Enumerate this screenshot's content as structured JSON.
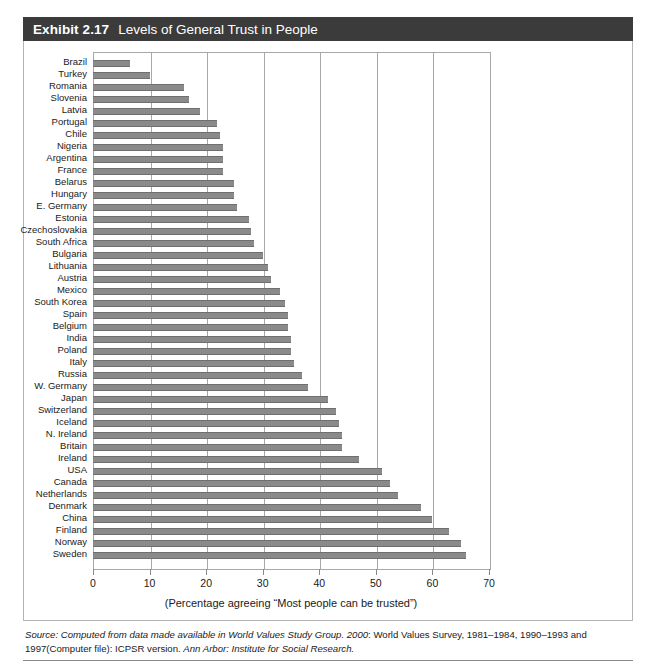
{
  "exhibit": {
    "label": "Exhibit 2.17",
    "title": "Levels of General Trust in People",
    "header_bg": "#3b3b3b",
    "bar_color": "#8a8a8a"
  },
  "axis_caption": "(Percentage agreeing “Most people can be trusted”)",
  "source": {
    "prefix": "Source:",
    "part_italic_1": "Computed from data made available in World Values Study Group. 2000",
    "part_plain_1": ": World Values Survey, 1981–1984, 1990–1993 and 1997(Computer file): ICPSR version. ",
    "part_italic_2": "Ann Arbor: Institute for Social Research."
  },
  "chart_data": {
    "type": "bar",
    "orientation": "horizontal",
    "title": "Levels of General Trust in People",
    "xlabel": "(Percentage agreeing “Most people can be trusted”)",
    "ylabel": "",
    "xlim": [
      0,
      70
    ],
    "xticks": [
      0,
      10,
      20,
      30,
      40,
      50,
      60,
      70
    ],
    "grid": true,
    "legend": "none",
    "categories": [
      "Brazil",
      "Turkey",
      "Romania",
      "Slovenia",
      "Latvia",
      "Portugal",
      "Chile",
      "Nigeria",
      "Argentina",
      "France",
      "Belarus",
      "Hungary",
      "E. Germany",
      "Estonia",
      "Czechoslovakia",
      "South Africa",
      "Bulgaria",
      "Lithuania",
      "Austria",
      "Mexico",
      "South Korea",
      "Spain",
      "Belgium",
      "India",
      "Poland",
      "Italy",
      "Russia",
      "W. Germany",
      "Japan",
      "Switzerland",
      "Iceland",
      "N. Ireland",
      "Britain",
      "Ireland",
      "USA",
      "Canada",
      "Netherlands",
      "Denmark",
      "China",
      "Finland",
      "Norway",
      "Sweden"
    ],
    "values": [
      6.5,
      10,
      16,
      17,
      19,
      22,
      22.5,
      23,
      23,
      23,
      25,
      25,
      25.5,
      27.5,
      28,
      28.5,
      30,
      31,
      31.5,
      33,
      34,
      34.5,
      34.5,
      35,
      35,
      35.5,
      37,
      38,
      41.5,
      43,
      43.5,
      44,
      44,
      47,
      51,
      52.5,
      54,
      58,
      60,
      63,
      65,
      66
    ]
  }
}
